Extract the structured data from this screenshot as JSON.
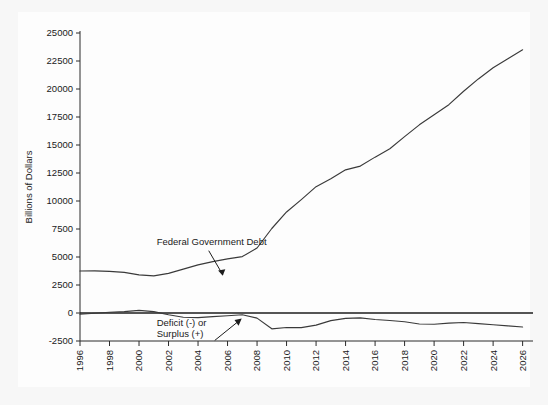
{
  "chart_data": {
    "type": "line",
    "title": "",
    "xlabel": "",
    "ylabel": "Billions of Dollars",
    "xlim": [
      1996,
      2026.5
    ],
    "ylim": [
      -2500,
      25000
    ],
    "grid": false,
    "legend_position": "none",
    "x_ticks": [
      "1996",
      "1998",
      "2000",
      "2002",
      "2004",
      "2006",
      "2008",
      "2010",
      "2012",
      "2014",
      "2016",
      "2018",
      "2020",
      "2022",
      "2024",
      "2026"
    ],
    "y_ticks": [
      "25000",
      "22500",
      "20000",
      "17500",
      "15000",
      "12500",
      "10000",
      "7500",
      "5000",
      "2500",
      "0",
      "-2500"
    ],
    "x": [
      1996,
      1997,
      1998,
      1999,
      2000,
      2001,
      2002,
      2003,
      2004,
      2005,
      2006,
      2007,
      2008,
      2009,
      2010,
      2011,
      2012,
      2013,
      2014,
      2015,
      2016,
      2017,
      2018,
      2019,
      2020,
      2021,
      2022,
      2023,
      2024,
      2025,
      2026
    ],
    "series": [
      {
        "name": "Federal Government Debt",
        "values": [
          3750,
          3760,
          3720,
          3630,
          3410,
          3320,
          3540,
          3913,
          4296,
          4592,
          4829,
          5035,
          5803,
          7545,
          9019,
          10128,
          11281,
          11983,
          12780,
          13117,
          13917,
          14665,
          15750,
          16800,
          17700,
          18600,
          19800,
          20900,
          21900,
          22700,
          23500
        ]
      },
      {
        "name": "Deficit (-) or Surplus (+)",
        "values": [
          -107,
          -22,
          69,
          126,
          236,
          128,
          -158,
          -378,
          -413,
          -318,
          -248,
          -161,
          -459,
          -1413,
          -1294,
          -1300,
          -1087,
          -680,
          -485,
          -438,
          -585,
          -665,
          -779,
          -984,
          -1000,
          -900,
          -850,
          -950,
          -1050,
          -1150,
          -1250
        ]
      }
    ],
    "annotations": [
      {
        "name": "federal-government-debt",
        "text": "Federal Government Debt",
        "x": 2001.2,
        "y": 6100
      },
      {
        "name": "deficit-or-surplus",
        "line1": "Deficit (-) or",
        "line2": "Surplus (+)",
        "x": 2001.2,
        "y": -1200
      }
    ],
    "colors": {
      "line": "#3a3a3a",
      "zero_line": "#1d1d1d",
      "axis": "#2b2b2b",
      "background": "#f7f7f7",
      "panel": "#fdfdfd"
    }
  }
}
